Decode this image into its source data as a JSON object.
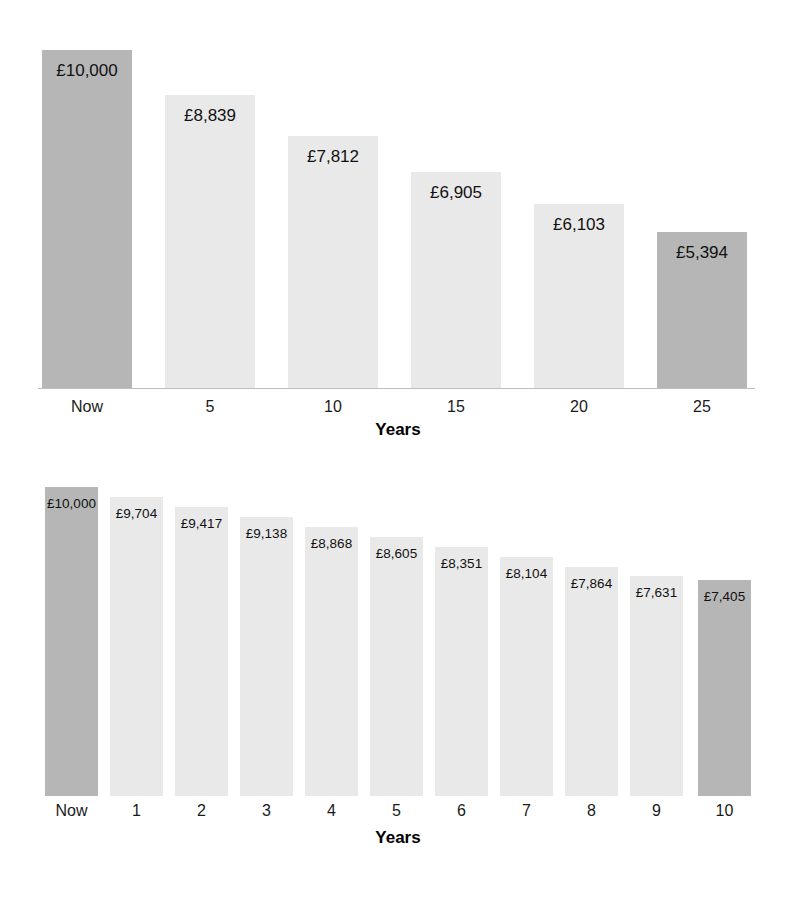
{
  "chart_data": [
    {
      "type": "bar",
      "id": "chart-one",
      "title": "",
      "xlabel": "Years",
      "ylabel": "",
      "ylim": [
        0,
        10000
      ],
      "grid": false,
      "legend": null,
      "categories": [
        "Now",
        "5",
        "10",
        "15",
        "20",
        "25"
      ],
      "values": [
        10000,
        8839,
        7812,
        6905,
        6103,
        5394
      ],
      "data_labels": [
        "£10,000",
        "£8,839",
        "£7,812",
        "£6,905",
        "£6,103",
        "£5,394"
      ],
      "bar_colors": [
        "#b6b6b6",
        "#e9e9e9",
        "#e9e9e9",
        "#e9e9e9",
        "#e9e9e9",
        "#b6b6b6"
      ],
      "bars": [
        {
          "label": "Now",
          "value": 10000,
          "data_label": "£10,000",
          "color": "#b6b6b6",
          "left": 42,
          "width": 90,
          "top": 50
        },
        {
          "label": "5",
          "value": 8839,
          "data_label": "£8,839",
          "color": "#e9e9e9",
          "left": 165,
          "width": 90,
          "top": 95
        },
        {
          "label": "10",
          "value": 7812,
          "data_label": "£7,812",
          "color": "#e9e9e9",
          "left": 288,
          "width": 90,
          "top": 136
        },
        {
          "label": "15",
          "value": 6905,
          "data_label": "£6,905",
          "color": "#e9e9e9",
          "left": 411,
          "width": 90,
          "top": 172
        },
        {
          "label": "20",
          "value": 6103,
          "data_label": "£6,103",
          "color": "#e9e9e9",
          "left": 534,
          "width": 90,
          "top": 204
        },
        {
          "label": "25",
          "value": 5394,
          "data_label": "£5,394",
          "color": "#b6b6b6",
          "left": 657,
          "width": 90,
          "top": 232
        }
      ]
    },
    {
      "type": "bar",
      "id": "chart-two",
      "title": "",
      "xlabel": "Years",
      "ylabel": "",
      "ylim": [
        0,
        10000
      ],
      "grid": false,
      "legend": null,
      "categories": [
        "Now",
        "1",
        "2",
        "3",
        "4",
        "5",
        "6",
        "7",
        "8",
        "9",
        "10"
      ],
      "values": [
        10000,
        9704,
        9417,
        9138,
        8868,
        8605,
        8351,
        8104,
        7864,
        7631,
        7405
      ],
      "data_labels": [
        "£10,000",
        "£9,704",
        "£9,417",
        "£9,138",
        "£8,868",
        "£8,605",
        "£8,351",
        "£8,104",
        "£7,864",
        "£7,631",
        "£7,405"
      ],
      "bar_colors": [
        "#b6b6b6",
        "#e9e9e9",
        "#e9e9e9",
        "#e9e9e9",
        "#e9e9e9",
        "#e9e9e9",
        "#e9e9e9",
        "#e9e9e9",
        "#e9e9e9",
        "#e9e9e9",
        "#b6b6b6"
      ],
      "bars": [
        {
          "label": "Now",
          "value": 10000,
          "data_label": "£10,000",
          "color": "#b6b6b6",
          "left": 45,
          "width": 53,
          "top": 17
        },
        {
          "label": "1",
          "value": 9704,
          "data_label": "£9,704",
          "color": "#e9e9e9",
          "left": 110,
          "width": 53,
          "top": 27
        },
        {
          "label": "2",
          "value": 9417,
          "data_label": "£9,417",
          "color": "#e9e9e9",
          "left": 175,
          "width": 53,
          "top": 37
        },
        {
          "label": "3",
          "value": 9138,
          "data_label": "£9,138",
          "color": "#e9e9e9",
          "left": 240,
          "width": 53,
          "top": 47
        },
        {
          "label": "4",
          "value": 8868,
          "data_label": "£8,868",
          "color": "#e9e9e9",
          "left": 305,
          "width": 53,
          "top": 57
        },
        {
          "label": "5",
          "value": 8605,
          "data_label": "£8,605",
          "color": "#e9e9e9",
          "left": 370,
          "width": 53,
          "top": 67
        },
        {
          "label": "6",
          "value": 8351,
          "data_label": "£8,351",
          "color": "#e9e9e9",
          "left": 435,
          "width": 53,
          "top": 77
        },
        {
          "label": "7",
          "value": 8104,
          "data_label": "£8,104",
          "color": "#e9e9e9",
          "left": 500,
          "width": 53,
          "top": 87
        },
        {
          "label": "8",
          "value": 7864,
          "data_label": "£7,864",
          "color": "#e9e9e9",
          "left": 565,
          "width": 53,
          "top": 97
        },
        {
          "label": "9",
          "value": 7631,
          "data_label": "£7,631",
          "color": "#e9e9e9",
          "left": 630,
          "width": 53,
          "top": 106
        },
        {
          "label": "10",
          "value": 7405,
          "data_label": "£7,405",
          "color": "#b6b6b6",
          "left": 698,
          "width": 53,
          "top": 110
        }
      ]
    }
  ],
  "colors": {
    "bar_highlight": "#b6b6b6",
    "bar_default": "#e9e9e9",
    "axis": "#bdbdbd",
    "text": "#111111",
    "background": "#ffffff"
  }
}
